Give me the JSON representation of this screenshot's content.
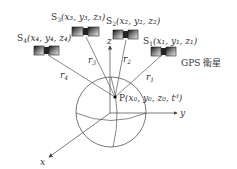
{
  "diagram": {
    "type": "gps-positioning",
    "satellites": [
      {
        "id": "S1",
        "label": "S",
        "sub": "1",
        "coords": "(x₁, y₁, z₁)",
        "range": "r",
        "range_sub": "1"
      },
      {
        "id": "S2",
        "label": "S",
        "sub": "2",
        "coords": "(x₂, y₂, z₂)",
        "range": "r",
        "range_sub": "2"
      },
      {
        "id": "S3",
        "label": "S",
        "sub": "3",
        "coords": "(x₃, y₃, z₃)",
        "range": "r",
        "range_sub": "3"
      },
      {
        "id": "S4",
        "label": "S",
        "sub": "4",
        "coords": "(x₄, y₄, z₄)",
        "range": "r",
        "range_sub": "4"
      }
    ],
    "receiver": {
      "label": "P",
      "coords": "(x₀, y₀, z₀, tᵈ)"
    },
    "satellite_caption": "GPS 衛星",
    "axes": {
      "x": "x",
      "y": "y",
      "z": "z"
    }
  }
}
